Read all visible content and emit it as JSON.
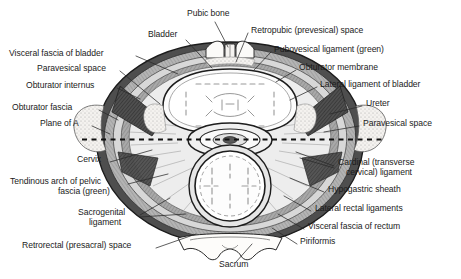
{
  "figure": {
    "type": "anatomical-cross-section",
    "orientation": "axial",
    "plane_marker": "Plane of A",
    "colors": {
      "background": "#ffffff",
      "outline": "#1b1b1b",
      "bone": "#f2f0ec",
      "muscle_dark": "#4a4a4a",
      "muscle_mid": "#8d8d8d",
      "muscle_light": "#c6c6c6",
      "fascia_band": "#b5b5b5",
      "fat_stipple": "#d9d9d9",
      "organ_fill": "#fbfbfb",
      "leader_line": "#2a2a2a",
      "dashed_plane": "#111111"
    }
  },
  "labels_left": [
    {
      "id": "visceral-fascia-of-bladder",
      "text": "Visceral fascia of bladder",
      "x": 9,
      "y": 54,
      "align": "left"
    },
    {
      "id": "paravesical-space-left",
      "text": "Paravesical space",
      "x": 37,
      "y": 69,
      "align": "left"
    },
    {
      "id": "obturator-internus",
      "text": "Obturator internus",
      "x": 26,
      "y": 86,
      "align": "left"
    },
    {
      "id": "obturator-fascia",
      "text": "Obturator fascia",
      "x": 12,
      "y": 108,
      "align": "left"
    },
    {
      "id": "plane-of-a",
      "text": "Plane of A",
      "x": 40,
      "y": 124,
      "align": "left"
    },
    {
      "id": "cervix",
      "text": "Cervix",
      "x": 77,
      "y": 160,
      "align": "left"
    },
    {
      "id": "tendinous-arch-line1",
      "text": "Tendinous arch of pelvic",
      "x": 10,
      "y": 182,
      "align": "left"
    },
    {
      "id": "tendinous-arch-line2",
      "text": "fascia (green)",
      "x": 58,
      "y": 192,
      "align": "left"
    },
    {
      "id": "sacrogenital-line1",
      "text": "Sacrogenital",
      "x": 78,
      "y": 213,
      "align": "left"
    },
    {
      "id": "sacrogenital-line2",
      "text": "ligament",
      "x": 89,
      "y": 223,
      "align": "left"
    },
    {
      "id": "retrorectal-space",
      "text": "Retrorectal (presacral) space",
      "x": 22,
      "y": 246,
      "align": "left"
    }
  ],
  "labels_top": [
    {
      "id": "pubic-bone",
      "text": "Pubic bone",
      "x": 187,
      "y": 14,
      "align": "left"
    },
    {
      "id": "bladder",
      "text": "Bladder",
      "x": 148,
      "y": 35,
      "align": "left"
    }
  ],
  "labels_right": [
    {
      "id": "retropubic-space",
      "text": "Retropubic (prevesical) space",
      "x": 251,
      "y": 31,
      "align": "left"
    },
    {
      "id": "pubovesical-ligament",
      "text": "Pubovesical ligament (green)",
      "x": 274,
      "y": 50,
      "align": "left"
    },
    {
      "id": "obturator-membrane",
      "text": "Obturator membrane",
      "x": 299,
      "y": 68,
      "align": "left"
    },
    {
      "id": "lateral-ligament-of-bladder",
      "text": "Lateral ligament of bladder",
      "x": 320,
      "y": 85,
      "align": "left"
    },
    {
      "id": "ureter",
      "text": "Ureter",
      "x": 366,
      "y": 104,
      "align": "left"
    },
    {
      "id": "paravesical-space-right",
      "text": "Paravesical space",
      "x": 363,
      "y": 124,
      "align": "left"
    },
    {
      "id": "cardinal-ligament-line1",
      "text": "Cardinal (transverse",
      "x": 338,
      "y": 163,
      "align": "left"
    },
    {
      "id": "cardinal-ligament-line2",
      "text": "cervical) ligament",
      "x": 346,
      "y": 173,
      "align": "left"
    },
    {
      "id": "hypogastric-sheath",
      "text": "Hypogastric sheath",
      "x": 328,
      "y": 190,
      "align": "left"
    },
    {
      "id": "lateral-rectal-ligaments",
      "text": "Lateral rectal ligaments",
      "x": 315,
      "y": 209,
      "align": "left"
    },
    {
      "id": "visceral-fascia-of-rectum",
      "text": "Visceral fascia of rectum",
      "x": 308,
      "y": 227,
      "align": "left"
    },
    {
      "id": "piriformis",
      "text": "Piriformis",
      "x": 300,
      "y": 242,
      "align": "left"
    }
  ],
  "labels_bottom": [
    {
      "id": "sacrum",
      "text": "Sacrum",
      "x": 219,
      "y": 265,
      "align": "left"
    }
  ]
}
